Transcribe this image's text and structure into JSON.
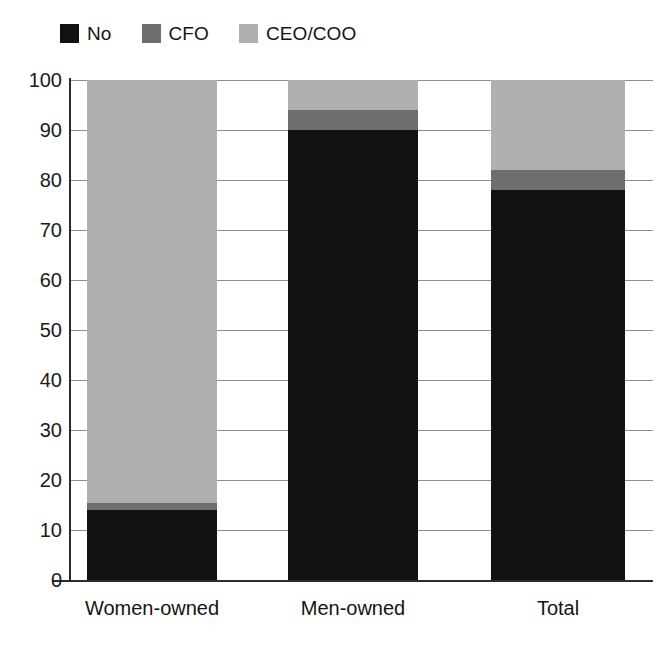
{
  "chart_data": {
    "type": "bar",
    "subtype": "stacked-bar",
    "title": "",
    "subtitle": "",
    "xlabel": "",
    "ylabel": "",
    "categories": [
      "Women-owned",
      "Men-owned",
      "Total"
    ],
    "series": [
      {
        "name": "No",
        "color": "#111111",
        "values": [
          14,
          90,
          78
        ]
      },
      {
        "name": "CFO",
        "color": "#6e6e6e",
        "values": [
          1.5,
          4,
          4
        ]
      },
      {
        "name": "CEO/COO",
        "color": "#b0b0b0",
        "values": [
          84.5,
          6,
          18
        ]
      }
    ],
    "ylim": [
      0,
      100
    ],
    "ytick_values": [
      0,
      10,
      20,
      30,
      40,
      50,
      60,
      70,
      80,
      90,
      100
    ],
    "ytick_labels": [
      "0",
      "10",
      "20",
      "30",
      "40",
      "50",
      "60",
      "70",
      "80",
      "90",
      "100"
    ],
    "grid": true,
    "grid_axis": "y",
    "legend_position": "top-left",
    "stack_order": [
      "No",
      "CFO",
      "CEO/COO"
    ],
    "annotations": []
  },
  "legend": {
    "items": [
      {
        "label": "No",
        "swatch": "legend-swatch-no",
        "color": "#111111"
      },
      {
        "label": "CFO",
        "swatch": "legend-swatch-cfo",
        "color": "#6e6e6e"
      },
      {
        "label": "CEO/COO",
        "swatch": "legend-swatch-ceo-coo",
        "color": "#b0b0b0"
      }
    ]
  },
  "axes": {
    "y": {
      "ticks": [
        "100",
        "90",
        "80",
        "70",
        "60",
        "50",
        "40",
        "30",
        "20",
        "10",
        "0"
      ]
    },
    "x": {
      "ticks": [
        "Women-owned",
        "Men-owned",
        "Total"
      ]
    }
  }
}
